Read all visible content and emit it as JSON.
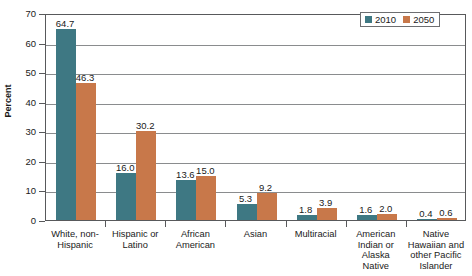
{
  "chart_data": {
    "type": "bar",
    "title": "",
    "xlabel": "",
    "ylabel": "Percent",
    "ylim": [
      0,
      70
    ],
    "yticks": [
      0,
      10,
      20,
      30,
      40,
      50,
      60,
      70
    ],
    "grid": true,
    "legend_position": "top-right",
    "categories": [
      "White, non-Hispanic",
      "Hispanic or Latino",
      "African American",
      "Asian",
      "Multiracial",
      "American Indian or Alaska Native",
      "Native Hawaiian and other Pacific Islander"
    ],
    "category_lines": [
      [
        "White, non-",
        "Hispanic"
      ],
      [
        "Hispanic or",
        "Latino"
      ],
      [
        "African",
        "American"
      ],
      [
        "Asian"
      ],
      [
        "Multiracial"
      ],
      [
        "American",
        "Indian or",
        "Alaska",
        "Native"
      ],
      [
        "Native",
        "Hawaiian and",
        "other Pacific",
        "Islander"
      ]
    ],
    "series": [
      {
        "name": "2010",
        "color": "#3e7883",
        "values": [
          64.7,
          16.0,
          13.6,
          5.3,
          1.8,
          1.6,
          0.4
        ],
        "labels": [
          "64.7",
          "16.0",
          "13.6",
          "5.3",
          "1.8",
          "1.6",
          "0.4"
        ]
      },
      {
        "name": "2050",
        "color": "#c8784a",
        "values": [
          46.3,
          30.2,
          15.0,
          9.2,
          3.9,
          2.0,
          0.6
        ],
        "labels": [
          "46.3",
          "30.2",
          "15.0",
          "9.2",
          "3.9",
          "2.0",
          "0.6"
        ]
      }
    ]
  },
  "legend": {
    "entries": [
      {
        "label": "2010",
        "color": "#3e7883"
      },
      {
        "label": "2050",
        "color": "#c8784a"
      }
    ]
  },
  "axis": {
    "y_title": "Percent",
    "y_tick_labels": [
      "0",
      "10",
      "20",
      "30",
      "40",
      "50",
      "60",
      "70"
    ]
  }
}
